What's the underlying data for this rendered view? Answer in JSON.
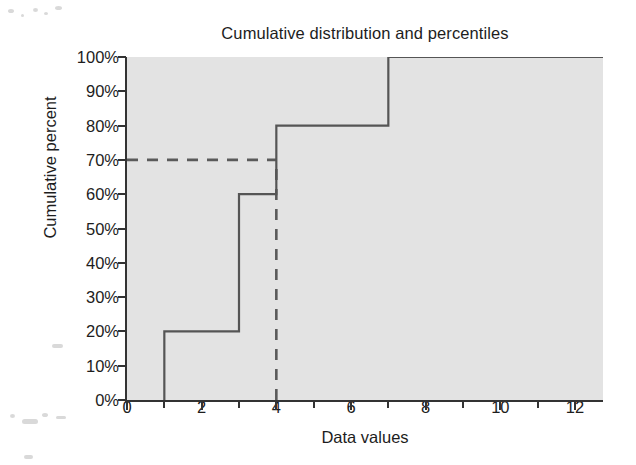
{
  "chart_data": {
    "type": "line",
    "subtype": "step-cdf",
    "title": "Cumulative distribution and percentiles",
    "xlabel": "Data values",
    "ylabel": "Cumulative percent",
    "xlim": [
      0,
      12.75
    ],
    "ylim": [
      0,
      100
    ],
    "grid": false,
    "legend": null,
    "background_color": "#e3e3e3",
    "line_color": "#555555",
    "dash_color": "#5a5a5a",
    "x_major_ticks": [
      0,
      2,
      4,
      6,
      8,
      10,
      12
    ],
    "x_minor_ticks": [
      1,
      3,
      5,
      7,
      9,
      11
    ],
    "x_tick_labels": [
      "0",
      "2",
      "4",
      "6",
      "8",
      "10",
      "12"
    ],
    "y_ticks": [
      0,
      10,
      20,
      30,
      40,
      50,
      60,
      70,
      80,
      90,
      100
    ],
    "y_tick_labels": [
      "0%",
      "10%",
      "20%",
      "30%",
      "40%",
      "50%",
      "60%",
      "70%",
      "80%",
      "90%",
      "100%"
    ],
    "step_points": [
      {
        "x": 1,
        "y": 0
      },
      {
        "x": 1,
        "y": 20
      },
      {
        "x": 3,
        "y": 20
      },
      {
        "x": 3,
        "y": 60
      },
      {
        "x": 4,
        "y": 60
      },
      {
        "x": 4,
        "y": 80
      },
      {
        "x": 7,
        "y": 80
      },
      {
        "x": 7,
        "y": 100
      },
      {
        "x": 12.75,
        "y": 100
      }
    ],
    "jumps": [
      {
        "x": 1,
        "from": 0,
        "to": 20
      },
      {
        "x": 3,
        "from": 20,
        "to": 60
      },
      {
        "x": 4,
        "from": 60,
        "to": 80
      },
      {
        "x": 7,
        "from": 80,
        "to": 100
      }
    ],
    "annotations": [
      {
        "name": "percentile-guide-horizontal",
        "style": "dashed",
        "y": 70,
        "x_start": 0,
        "x_end": 4
      },
      {
        "name": "percentile-guide-vertical",
        "style": "dashed",
        "x": 4,
        "y_start": 0,
        "y_end": 70
      }
    ]
  }
}
